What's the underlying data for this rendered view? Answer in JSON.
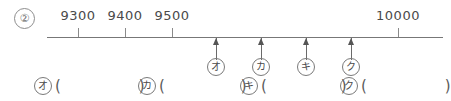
{
  "worksheet": {
    "problem_number": "②",
    "number_line": {
      "labeled_ticks": [
        {
          "label": "9300",
          "x": 78
        },
        {
          "label": "9400",
          "x": 125
        },
        {
          "label": "9500",
          "x": 172
        },
        {
          "label": "10000",
          "x": 398
        }
      ],
      "arrow_markers": [
        {
          "kana": "オ",
          "x": 216
        },
        {
          "kana": "カ",
          "x": 261
        },
        {
          "kana": "キ",
          "x": 306
        },
        {
          "kana": "ク",
          "x": 351
        }
      ]
    },
    "answers": [
      {
        "kana": "オ",
        "open": "(",
        "value": "",
        "close": ")",
        "x": 34,
        "width": 100
      },
      {
        "kana": "カ",
        "open": "(",
        "value": "",
        "close": ")",
        "x": 138,
        "width": 100
      },
      {
        "kana": "キ",
        "open": "(",
        "value": "",
        "close": ")",
        "x": 240,
        "width": 100
      },
      {
        "kana": "ク",
        "open": "(",
        "value": "",
        "close": ")",
        "x": 340,
        "width": 104
      }
    ]
  }
}
